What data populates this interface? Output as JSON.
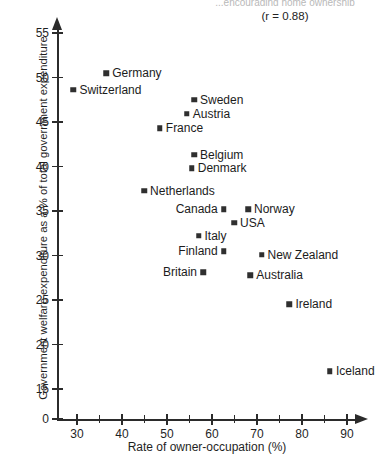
{
  "chart_data": {
    "type": "scatter",
    "title": "...encouraging home ownership",
    "annotation": "(r = 0.88)",
    "correlation": 0.88,
    "xlabel": "Rate of owner-occupation (%)",
    "ylabel": "Government welfare expenditure as a % of total government expenditure",
    "xlim": [
      25,
      93
    ],
    "ylim": [
      13,
      57
    ],
    "xticks": [
      30,
      40,
      50,
      60,
      70,
      80,
      90
    ],
    "xticks_minor": [
      35,
      45,
      55,
      65,
      75,
      85
    ],
    "yticks": [
      55,
      50,
      45,
      40,
      35,
      30,
      25,
      20,
      15,
      0
    ],
    "y_axis_break": true,
    "grid": false,
    "legend": "none",
    "points": [
      {
        "label": "Germany",
        "x": 36.5,
        "y": 50.5,
        "label_side": "right"
      },
      {
        "label": "Switzerland",
        "x": 29.2,
        "y": 48.6,
        "label_side": "right"
      },
      {
        "label": "Sweden",
        "x": 56.0,
        "y": 47.5,
        "label_side": "right"
      },
      {
        "label": "Austria",
        "x": 54.4,
        "y": 45.9,
        "label_side": "right"
      },
      {
        "label": "France",
        "x": 48.4,
        "y": 44.3,
        "label_side": "right"
      },
      {
        "label": "Belgium",
        "x": 56.0,
        "y": 41.3,
        "label_side": "right"
      },
      {
        "label": "Denmark",
        "x": 55.5,
        "y": 39.8,
        "label_side": "right"
      },
      {
        "label": "Netherlands",
        "x": 44.9,
        "y": 37.3,
        "label_side": "right"
      },
      {
        "label": "Canada",
        "x": 62.6,
        "y": 35.2,
        "label_side": "left"
      },
      {
        "label": "Norway",
        "x": 68.0,
        "y": 35.2,
        "label_side": "right"
      },
      {
        "label": "USA",
        "x": 64.9,
        "y": 33.7,
        "label_side": "right"
      },
      {
        "label": "Italy",
        "x": 57.0,
        "y": 32.2,
        "label_side": "right"
      },
      {
        "label": "Finland",
        "x": 62.6,
        "y": 30.5,
        "label_side": "left"
      },
      {
        "label": "New Zealand",
        "x": 71.0,
        "y": 30.1,
        "label_side": "right"
      },
      {
        "label": "Britain",
        "x": 58.0,
        "y": 28.1,
        "label_side": "left"
      },
      {
        "label": "Australia",
        "x": 68.5,
        "y": 27.8,
        "label_side": "right"
      },
      {
        "label": "Ireland",
        "x": 77.2,
        "y": 24.5,
        "label_side": "right"
      },
      {
        "label": "Iceland",
        "x": 86.2,
        "y": 17.0,
        "label_side": "right"
      }
    ]
  }
}
